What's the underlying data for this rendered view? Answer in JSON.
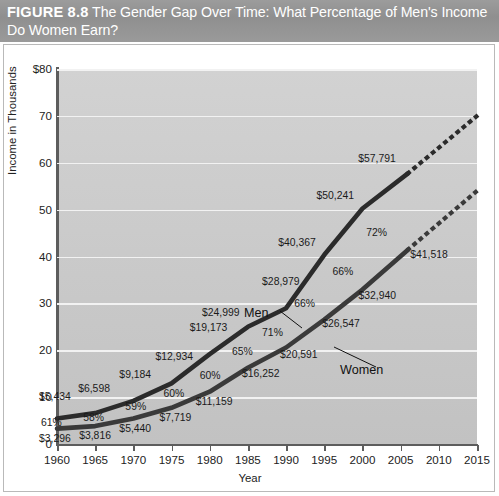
{
  "header": {
    "figure_number": "FIGURE 8.8",
    "title": "The Gender Gap Over Time: What Percentage of Men's Income Do Women Earn?",
    "title_line1": "The Gender Gap Over Time: What Percentage of Men's Income",
    "title_line2": "Do Women Earn?"
  },
  "chart_data": {
    "type": "line",
    "title": "The Gender Gap Over Time: What Percentage of Men's Income Do Women Earn?",
    "xlabel": "Year",
    "ylabel": "Income in Thousands",
    "xlim": [
      1960,
      2015
    ],
    "ylim": [
      0,
      80
    ],
    "grid": true,
    "legend": "inline-series-labels",
    "x": [
      1960,
      1965,
      1970,
      1975,
      1980,
      1985,
      1990,
      1995,
      2000,
      2006
    ],
    "xticks": [
      "1960",
      "1965",
      "1970",
      "1975",
      "1980",
      "1985",
      "1990",
      "1995",
      "2000",
      "2005",
      "2010",
      "2015"
    ],
    "xtick_values": [
      1960,
      1965,
      1970,
      1975,
      1980,
      1985,
      1990,
      1995,
      2000,
      2005,
      2010,
      2015
    ],
    "yticks": [
      "$80",
      "70",
      "60",
      "50",
      "40",
      "30",
      "20",
      "10",
      "0"
    ],
    "ytick_values": [
      80,
      70,
      60,
      50,
      40,
      30,
      20,
      10,
      0
    ],
    "series": [
      {
        "name": "Men",
        "label": "Men",
        "values": [
          5434,
          6598,
          9184,
          12934,
          19173,
          24999,
          28979,
          40367,
          50241,
          57791
        ],
        "value_labels": [
          "$5,434",
          "$6,598",
          "$9,184",
          "$12,934",
          "$19,173",
          "$24,999",
          "$28,979",
          "$40,367",
          "$50,241",
          "$57,791"
        ],
        "style": "solid",
        "color": "#2b2b2b",
        "projection": {
          "style": "dotted",
          "from_year": 2006,
          "from_value": 57791,
          "to_year": 2015,
          "to_value": 70000
        }
      },
      {
        "name": "Women",
        "label": "Women",
        "values": [
          3296,
          3816,
          5440,
          7719,
          11159,
          16252,
          20591,
          26547,
          32940,
          41518
        ],
        "value_labels": [
          "$3,296",
          "$3,816",
          "$5,440",
          "$7,719",
          "$11,159",
          "$16,252",
          "$20,591",
          "$26,547",
          "$32,940",
          "$41,518"
        ],
        "style": "solid",
        "color": "#3a3a3a",
        "projection": {
          "style": "dotted",
          "from_year": 2006,
          "from_value": 41518,
          "to_year": 2015,
          "to_value": 54000
        }
      }
    ],
    "ratio_labels": {
      "name": "Women's income as percentage of men's income",
      "values": [
        "61%",
        "58%",
        "59%",
        "60%",
        "60%",
        "65%",
        "71%",
        "66%",
        "66%",
        "72%"
      ],
      "years": [
        1960,
        1965,
        1970,
        1975,
        1980,
        1985,
        1990,
        1995,
        2000,
        2006
      ]
    },
    "colors": {
      "plot_background": "#c9c9c9",
      "gridline": "#f2f2f2",
      "axis": "#5d5d5d",
      "men_line": "#2b2b2b",
      "women_line": "#3a3a3a",
      "header_band": "#969696",
      "header_text": "#ffffff"
    }
  }
}
